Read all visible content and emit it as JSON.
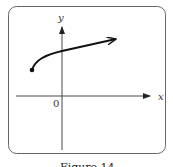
{
  "figure": {
    "caption": "Figure 14",
    "axes": {
      "x_label": "x",
      "y_label": "y",
      "origin_label": "0"
    },
    "curve": {
      "description": "Square-root-like curve starting at a closed dot left of the y-axis, rising and continuing to the right with an arrow",
      "start_point": "closed-dot",
      "end": "arrow"
    },
    "colors": {
      "frame": "#666666",
      "axes": "#333333",
      "curve": "#111111"
    }
  }
}
